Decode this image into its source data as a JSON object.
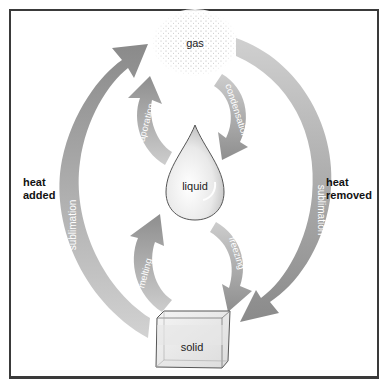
{
  "diagram": {
    "states": {
      "gas": "gas",
      "liquid": "liquid",
      "solid": "solid"
    },
    "processes": {
      "sublimation_up": "sublimation",
      "sublimation_down": "sublimation",
      "evaporation": "evaporation",
      "condensation": "condensation",
      "melting": "melting",
      "freezing": "freezing"
    },
    "side_labels": {
      "left_line1": "heat",
      "left_line2": "added",
      "right_line1": "heat",
      "right_line2": "removed"
    },
    "colors": {
      "arrow_dark": "#8c8c8c",
      "arrow_light": "#cfcfcf",
      "frame": "#3a3a3a",
      "text": "#111111",
      "arrow_text": "#ffffff"
    }
  }
}
